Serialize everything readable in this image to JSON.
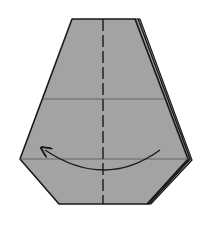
{
  "diagram": {
    "type": "origami-step",
    "description": "Folded paper model, turn over / fold left flap behind along center",
    "colors": {
      "paper": "#a3a3a3",
      "outline": "#1a1a1a",
      "crease": "#555555",
      "background": "#ffffff"
    },
    "shape": {
      "front": [
        [
          72,
          19
        ],
        [
          135,
          19
        ],
        [
          188,
          159
        ],
        [
          147,
          204
        ],
        [
          59,
          204
        ],
        [
          20,
          159
        ]
      ],
      "layers": [
        [
          [
            135,
            19
          ],
          [
            138,
            19
          ],
          [
            190,
            159
          ],
          [
            149,
            204
          ],
          [
            147,
            204
          ],
          [
            188,
            159
          ]
        ],
        [
          [
            138,
            19
          ],
          [
            140,
            19
          ],
          [
            192,
            160
          ],
          [
            151,
            204
          ],
          [
            149,
            204
          ],
          [
            190,
            159
          ]
        ]
      ]
    },
    "creases": [
      {
        "name": "horizontal-crease-upper",
        "x1": 43,
        "y1": 99,
        "x2": 164,
        "y2": 99
      },
      {
        "name": "horizontal-crease-lower",
        "x1": 20,
        "y1": 159,
        "x2": 188,
        "y2": 159
      }
    ],
    "valley_fold_line": {
      "x1": 103,
      "y1": 19,
      "x2": 103,
      "y2": 204,
      "style": "dashed"
    },
    "arrow": {
      "path": "M160,150 Q105,190 45,150",
      "direction": "right-to-left",
      "head_at": [
        45,
        150
      ]
    }
  }
}
